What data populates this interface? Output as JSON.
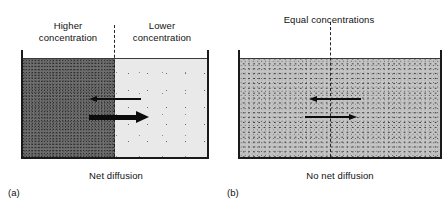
{
  "figure": {
    "panels": [
      {
        "label": "(a)",
        "caption": "Net diffusion",
        "headings": {
          "left": "Higher\nconcentration",
          "right": "Lower\nconcentration"
        },
        "regions": [
          {
            "name": "high-concentration-region",
            "shading": "dark dense stipple",
            "color": "#6f6f6f"
          },
          {
            "name": "low-concentration-region",
            "shading": "light sparse stipple",
            "color": "#e9e9e9"
          }
        ],
        "divider": "dashed-vertical-line",
        "arrows": [
          {
            "name": "leftward-flux-arrow",
            "direction": "left",
            "weight": "thin"
          },
          {
            "name": "rightward-flux-arrow",
            "direction": "right",
            "weight": "thick"
          }
        ]
      },
      {
        "label": "(b)",
        "caption": "No net diffusion",
        "headings": {
          "center": "Equal concentrations"
        },
        "regions": [
          {
            "name": "equal-concentration-region",
            "shading": "medium uniform stipple",
            "color": "#c5c5c5"
          }
        ],
        "divider": "dashed-vertical-line",
        "arrows": [
          {
            "name": "leftward-flux-arrow",
            "direction": "left",
            "weight": "thin"
          },
          {
            "name": "rightward-flux-arrow",
            "direction": "right",
            "weight": "thin"
          }
        ]
      }
    ],
    "colors": {
      "background": "#ffffff",
      "ink": "#111111",
      "wall": "#1a1a1a",
      "dark_region": "#6f6f6f",
      "light_region": "#e9e9e9",
      "equal_region": "#c5c5c5"
    }
  }
}
